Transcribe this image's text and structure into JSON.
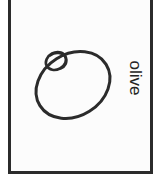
{
  "illustration": {
    "kind": "line-drawing",
    "subject": "olive",
    "caption": "olive",
    "caption_orientation": "rotated-90-clockwise",
    "background_color": "#fcfcfc",
    "ink_color": "#2b2b2b",
    "frame": {
      "name": "picture-frame",
      "stroke_color": "#2b2b2b",
      "stroke_width": 3,
      "top_edge_cropped": true
    },
    "shapes": [
      {
        "name": "olive-body",
        "type": "ellipse",
        "center_x": 73,
        "center_y": 85,
        "radius_x": 39,
        "radius_y": 31,
        "rotation_deg": -32,
        "stroke_width": 3
      },
      {
        "name": "olive-pit-hole",
        "type": "ellipse",
        "center_x": 56,
        "center_y": 61,
        "radius_x": 10,
        "radius_y": 8,
        "rotation_deg": -28,
        "stroke_width": 2.6
      },
      {
        "name": "olive-pit-hole-inner-arc",
        "type": "arc",
        "center_x": 59,
        "center_y": 60,
        "radius_x": 8,
        "radius_y": 7,
        "rotation_deg": -28,
        "stroke_width": 2.2
      }
    ]
  }
}
